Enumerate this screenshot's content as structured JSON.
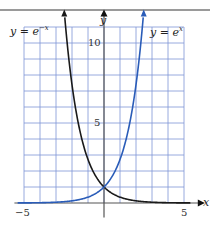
{
  "chart_data": {
    "type": "line",
    "title": "",
    "xlabel": "x",
    "ylabel": "y",
    "xlim": [
      -5,
      5
    ],
    "ylim": [
      0,
      11
    ],
    "grid": true,
    "x_ticks": [
      "-5",
      "5"
    ],
    "y_ticks": [
      "5",
      "10"
    ],
    "series": [
      {
        "name": "y = e^{-x}",
        "label": "y = e",
        "exponent": "−x",
        "color": "#1a1a1a",
        "x": [
          -2.4,
          -2,
          -1.5,
          -1,
          -0.5,
          0,
          0.5,
          1,
          2,
          3,
          4,
          5
        ],
        "y": [
          11.02,
          7.39,
          4.48,
          2.72,
          1.65,
          1,
          0.61,
          0.37,
          0.14,
          0.05,
          0.02,
          0.01
        ]
      },
      {
        "name": "y = e^{x}",
        "label": "y = e",
        "exponent": "x",
        "color": "#2a5cb8",
        "x": [
          -5,
          -4,
          -3,
          -2,
          -1,
          -0.5,
          0,
          0.5,
          1,
          1.5,
          2,
          2.4
        ],
        "y": [
          0.01,
          0.02,
          0.05,
          0.14,
          0.37,
          0.61,
          1,
          1.65,
          2.72,
          4.48,
          7.39,
          11.02
        ]
      }
    ],
    "legend": "inline labels at top of curves"
  },
  "labels": {
    "x_axis": "x",
    "y_axis": "y",
    "tick_x_min": "−5",
    "tick_x_max": "5",
    "tick_y_5": "5",
    "tick_y_10": "10",
    "curve_left_base": "y = e",
    "curve_left_exp": "−x",
    "curve_right_base": "y = e",
    "curve_right_exp": "x"
  },
  "colors": {
    "grid": "#7f95d6",
    "blue_curve": "#2a5cb8",
    "black_curve": "#1a1a1a",
    "axis": "#555555"
  }
}
